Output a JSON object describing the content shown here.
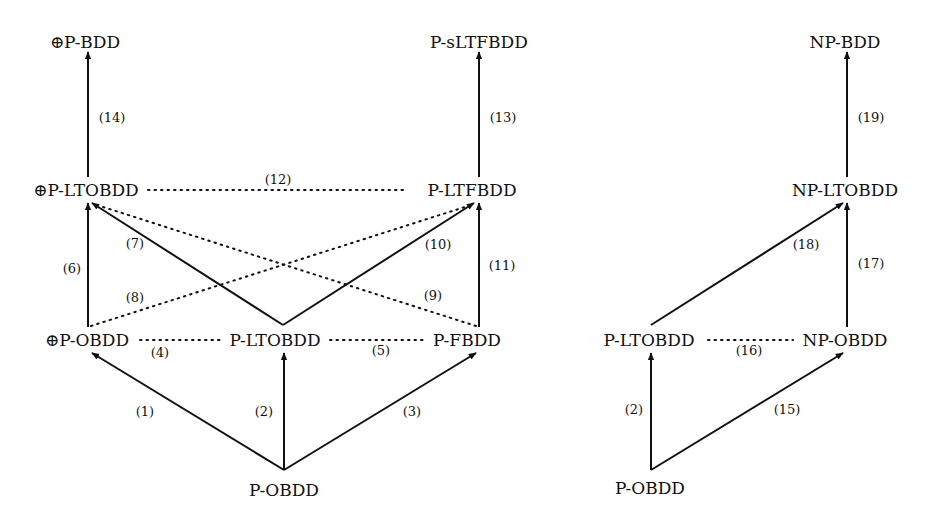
{
  "diagram": {
    "left": {
      "nodes": {
        "xor_p_bdd": "⊕P-BDD",
        "p_sltfbdd": "P-sLTFBDD",
        "xor_p_ltobdd": "⊕P-LTOBDD",
        "p_ltfbdd": "P-LTFBDD",
        "xor_p_obdd": "⊕P-OBDD",
        "p_ltobdd": "P-LTOBDD",
        "p_fbdd": "P-FBDD",
        "p_obdd": "P-OBDD"
      },
      "edges": [
        {
          "id": "1",
          "label": "(1)",
          "from": "P-OBDD",
          "to": "⊕P-OBDD",
          "style": "solid"
        },
        {
          "id": "2",
          "label": "(2)",
          "from": "P-OBDD",
          "to": "P-LTOBDD",
          "style": "solid"
        },
        {
          "id": "3",
          "label": "(3)",
          "from": "P-OBDD",
          "to": "P-FBDD",
          "style": "solid"
        },
        {
          "id": "4",
          "label": "(4)",
          "from": "⊕P-OBDD",
          "to": "P-LTOBDD",
          "style": "dotted"
        },
        {
          "id": "5",
          "label": "(5)",
          "from": "P-LTOBDD",
          "to": "P-FBDD",
          "style": "dotted"
        },
        {
          "id": "6",
          "label": "(6)",
          "from": "⊕P-OBDD",
          "to": "⊕P-LTOBDD",
          "style": "solid"
        },
        {
          "id": "7",
          "label": "(7)",
          "from": "P-LTOBDD",
          "to": "⊕P-LTOBDD",
          "style": "solid"
        },
        {
          "id": "8",
          "label": "(8)",
          "from": "⊕P-OBDD",
          "to": "P-LTFBDD",
          "style": "dotted"
        },
        {
          "id": "9",
          "label": "(9)",
          "from": "P-FBDD",
          "to": "⊕P-LTOBDD",
          "style": "dotted"
        },
        {
          "id": "10",
          "label": "(10)",
          "from": "P-LTOBDD",
          "to": "P-LTFBDD",
          "style": "solid"
        },
        {
          "id": "11",
          "label": "(11)",
          "from": "P-FBDD",
          "to": "P-LTFBDD",
          "style": "solid"
        },
        {
          "id": "12",
          "label": "(12)",
          "from": "⊕P-LTOBDD",
          "to": "P-LTFBDD",
          "style": "dotted"
        },
        {
          "id": "13",
          "label": "(13)",
          "from": "P-LTFBDD",
          "to": "P-sLTFBDD",
          "style": "solid"
        },
        {
          "id": "14",
          "label": "(14)",
          "from": "⊕P-LTOBDD",
          "to": "⊕P-BDD",
          "style": "solid"
        }
      ]
    },
    "right": {
      "nodes": {
        "np_bdd": "NP-BDD",
        "np_ltobdd": "NP-LTOBDD",
        "p_ltobdd": "P-LTOBDD",
        "np_obdd": "NP-OBDD",
        "p_obdd": "P-OBDD"
      },
      "edges": [
        {
          "id": "2",
          "label": "(2)",
          "from": "P-OBDD",
          "to": "P-LTOBDD",
          "style": "solid"
        },
        {
          "id": "15",
          "label": "(15)",
          "from": "P-OBDD",
          "to": "NP-OBDD",
          "style": "solid"
        },
        {
          "id": "16",
          "label": "(16)",
          "from": "P-LTOBDD",
          "to": "NP-OBDD",
          "style": "dotted"
        },
        {
          "id": "17",
          "label": "(17)",
          "from": "NP-OBDD",
          "to": "NP-LTOBDD",
          "style": "solid"
        },
        {
          "id": "18",
          "label": "(18)",
          "from": "P-LTOBDD",
          "to": "NP-LTOBDD",
          "style": "solid"
        },
        {
          "id": "19",
          "label": "(19)",
          "from": "NP-LTOBDD",
          "to": "NP-BDD",
          "style": "solid"
        }
      ]
    }
  }
}
